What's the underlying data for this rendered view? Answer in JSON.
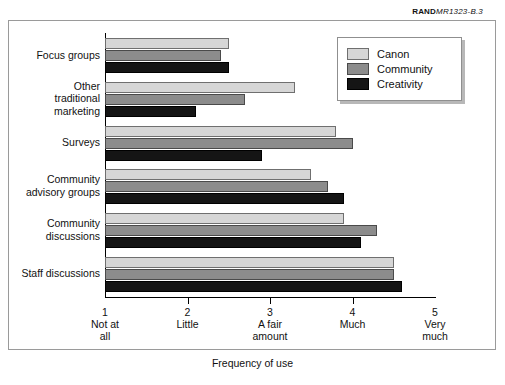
{
  "credit": {
    "brand": "RAND",
    "number": "MR1323-B.3"
  },
  "chart_data": {
    "type": "bar",
    "orientation": "horizontal",
    "title": "",
    "xlabel": "Frequency of use",
    "ylabel": "",
    "xlim": [
      1,
      5
    ],
    "grid": false,
    "legend_position": "top-right",
    "categories": [
      "Focus groups",
      "Other traditional marketing",
      "Surveys",
      "Community advisory groups",
      "Community discussions",
      "Staff discussions"
    ],
    "category_lines": [
      [
        "Focus groups"
      ],
      [
        "Other",
        "traditional",
        "marketing"
      ],
      [
        "Surveys"
      ],
      [
        "Community",
        "advisory groups"
      ],
      [
        "Community",
        "discussions"
      ],
      [
        "Staff discussions"
      ]
    ],
    "xticks": [
      1,
      2,
      3,
      4,
      5
    ],
    "xticklabels": [
      {
        "value": "1",
        "text": [
          "Not at",
          "all"
        ]
      },
      {
        "value": "2",
        "text": [
          "Little"
        ]
      },
      {
        "value": "3",
        "text": [
          "A fair",
          "amount"
        ]
      },
      {
        "value": "4",
        "text": [
          "Much"
        ]
      },
      {
        "value": "5",
        "text": [
          "Very",
          "much"
        ]
      }
    ],
    "series": [
      {
        "name": "Canon",
        "color": "#d6d6d6",
        "values": [
          2.5,
          3.3,
          3.8,
          3.5,
          3.9,
          4.5
        ]
      },
      {
        "name": "Community",
        "color": "#8c8c8c",
        "values": [
          2.4,
          2.7,
          4.0,
          3.7,
          4.3,
          4.5
        ]
      },
      {
        "name": "Creativity",
        "color": "#151515",
        "values": [
          2.5,
          2.1,
          2.9,
          3.9,
          4.1,
          4.6
        ]
      }
    ]
  },
  "legend": {
    "items": [
      {
        "label": "Canon"
      },
      {
        "label": "Community"
      },
      {
        "label": "Creativity"
      }
    ]
  }
}
